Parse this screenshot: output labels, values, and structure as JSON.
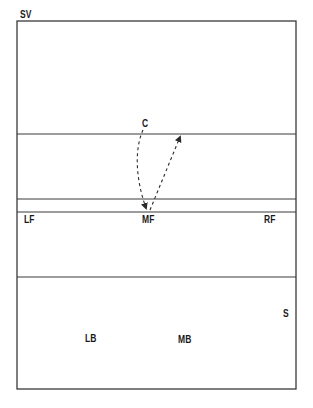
{
  "diagram": {
    "title_label": "SV",
    "colors": {
      "line": "#3a3a3a",
      "text": "#1a1a1a",
      "background": "#ffffff"
    },
    "court": {
      "left": 17,
      "top": 21,
      "right": 296,
      "bottom": 389
    },
    "horizontal_lines_y": [
      134,
      199,
      212,
      277
    ],
    "positions": [
      {
        "id": "C",
        "label": "C",
        "x": 142,
        "y": 119
      },
      {
        "id": "LF",
        "label": "LF",
        "x": 24,
        "y": 215
      },
      {
        "id": "MF",
        "label": "MF",
        "x": 142,
        "y": 215
      },
      {
        "id": "RF",
        "label": "RF",
        "x": 264,
        "y": 215
      },
      {
        "id": "S",
        "label": "S",
        "x": 283,
        "y": 309
      },
      {
        "id": "LB",
        "label": "LB",
        "x": 85,
        "y": 334
      },
      {
        "id": "MB",
        "label": "MB",
        "x": 178,
        "y": 335
      }
    ],
    "arrows": [
      {
        "from": "C",
        "to": "MF",
        "style": "dashed",
        "shape": "curved"
      },
      {
        "from": "MF",
        "to": "front-zone",
        "style": "dashed",
        "shape": "straight"
      }
    ]
  }
}
